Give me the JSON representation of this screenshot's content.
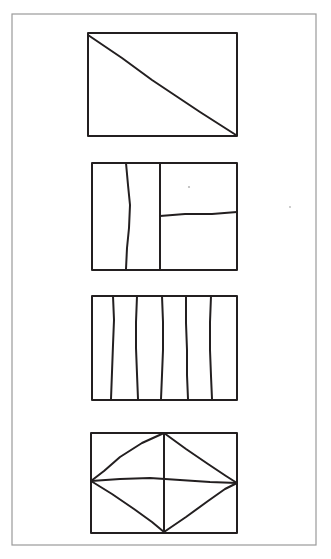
{
  "page": {
    "background_color": "#ffffff",
    "ink_color": "#231f20",
    "frame_color": "#9a9a9a",
    "width": 331,
    "height": 559
  },
  "frame": {
    "name": "page-border",
    "x": 12,
    "y": 14,
    "width": 304,
    "height": 531,
    "stroke_width": 1.2
  },
  "figures": [
    {
      "id": "figure-1",
      "label": "rectangle with single diagonal",
      "box": {
        "x": 88,
        "y": 33,
        "width": 149,
        "height": 103
      },
      "stroke_width": 2.0,
      "partitions": 2,
      "inner_lines": [
        {
          "name": "diagonal-line",
          "type": "polyline",
          "points": "88,35 122,58 152,80 176,96 200,112 236,135"
        }
      ]
    },
    {
      "id": "figure-2",
      "label": "rectangle split into three parts",
      "box": {
        "x": 92,
        "y": 163,
        "width": 145,
        "height": 107
      },
      "stroke_width": 2.0,
      "partitions": 3,
      "inner_lines": [
        {
          "name": "vertical-divider-left",
          "type": "polyline",
          "points": "126,163 128,185 130,205 129,228 127,248 126,269"
        },
        {
          "name": "vertical-divider-right",
          "type": "polyline",
          "points": "160,163 160,195 160,232 160,269"
        },
        {
          "name": "horizontal-divider-right",
          "type": "polyline",
          "points": "160,216 185,214 212,214 237,212"
        }
      ]
    },
    {
      "id": "figure-3",
      "label": "rectangle split into six vertical strips",
      "box": {
        "x": 92,
        "y": 296,
        "width": 145,
        "height": 104
      },
      "stroke_width": 2.0,
      "partitions": 6,
      "inner_lines": [
        {
          "name": "vertical-strip-line-1",
          "type": "polyline",
          "points": "113,296 114,320 113,345 112,372 111,399"
        },
        {
          "name": "vertical-strip-line-2",
          "type": "polyline",
          "points": "137,296 136,322 136,348 137,374 138,399"
        },
        {
          "name": "vertical-strip-line-3",
          "type": "polyline",
          "points": "162,296 163,322 163,350 162,375 161,399"
        },
        {
          "name": "vertical-strip-line-4",
          "type": "polyline",
          "points": "186,296 186,323 187,350 187,375 188,399"
        },
        {
          "name": "vertical-strip-line-5",
          "type": "polyline",
          "points": "211,296 210,322 210,350 211,376 212,399"
        }
      ]
    },
    {
      "id": "figure-4",
      "label": "rectangle with inscribed diamond and center cross",
      "box": {
        "x": 91,
        "y": 433,
        "width": 146,
        "height": 100
      },
      "stroke_width": 2.0,
      "partitions": 8,
      "inner_lines": [
        {
          "name": "diamond-edge-top-left",
          "type": "polyline",
          "points": "164,433 142,443 120,457 104,471 91,481"
        },
        {
          "name": "diamond-edge-top-right",
          "type": "polyline",
          "points": "164,433 186,449 208,464 226,476 237,483"
        },
        {
          "name": "diamond-edge-bottom-left",
          "type": "polyline",
          "points": "91,481 112,494 134,509 152,522 164,532"
        },
        {
          "name": "diamond-edge-bottom-right",
          "type": "polyline",
          "points": "164,532 186,517 208,501 225,489 237,483"
        },
        {
          "name": "center-vertical-line",
          "type": "polyline",
          "points": "164,433 164,460 164,482 164,506 164,532"
        },
        {
          "name": "center-horizontal-line",
          "type": "polyline",
          "points": "91,481 120,479 150,478 180,480 210,482 237,483"
        }
      ]
    }
  ],
  "specks": [
    {
      "name": "paper-speck",
      "x": 189,
      "y": 187,
      "r": 1.1
    },
    {
      "name": "paper-speck",
      "x": 290,
      "y": 207,
      "r": 0.9
    }
  ]
}
